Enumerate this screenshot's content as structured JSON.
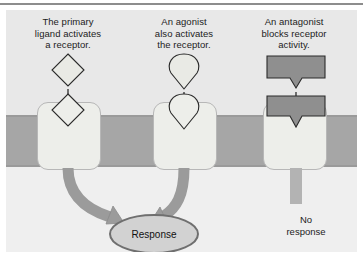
{
  "figure": {
    "title_rule": true,
    "background": "#ebebeb",
    "membrane_color": "#a6a6a6",
    "receptor_fill": "#edeeea",
    "ligand_fill": "#e9eae5",
    "antagonist_fill": "#8f8f8f",
    "arrow_color": "#9b9b9b",
    "response_oval_fill": "#d2d2d2"
  },
  "columns": [
    {
      "id": "primary-ligand",
      "caption_lines": [
        "The primary",
        "ligand activates",
        "a receptor."
      ],
      "ligand_shape": "diamond",
      "bound_shape": "diamond",
      "outcome": "response"
    },
    {
      "id": "agonist",
      "caption_lines": [
        "An agonist",
        "also activates",
        "the receptor."
      ],
      "ligand_shape": "teardrop",
      "bound_shape": "teardrop",
      "outcome": "response"
    },
    {
      "id": "antagonist",
      "caption_lines": [
        "An antagonist",
        "blocks receptor",
        "activity."
      ],
      "ligand_shape": "notched-block",
      "bound_shape": "notched-block",
      "outcome": "no-response"
    }
  ],
  "outcomes": {
    "response_label": "Response",
    "no_response_lines": [
      "No",
      "response"
    ]
  }
}
